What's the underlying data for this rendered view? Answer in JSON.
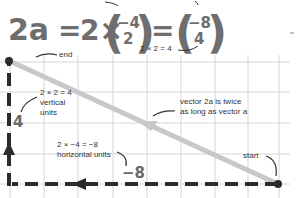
{
  "equation": {
    "lhs": "2a",
    "equals1": "=",
    "scalar": "2×",
    "vec_a": {
      "top": "−4",
      "bottom": "2"
    },
    "equals2": "=",
    "vec_2a": {
      "top": "−8",
      "bottom": "4"
    },
    "top_label_partial": "vector a",
    "annotation_bottom": "2 × 2 = 4"
  },
  "annotations": {
    "end": "end",
    "start": "start",
    "vertical_line1": "2 × 2 = 4",
    "vertical_line2": "vertical",
    "vertical_line3": "units",
    "vertical_value": "4",
    "horizontal_line1": "2 × −4 = −8",
    "horizontal_line2": "horizontal units",
    "horizontal_value": "−8",
    "twice_line1": "vector 2a is twice",
    "twice_line2": "as long as vector a"
  },
  "colors": {
    "grid": "#d4d4d4",
    "vector": "#c8c8c8",
    "components": "#2b2b2b",
    "equation": "#6e6e6e"
  }
}
